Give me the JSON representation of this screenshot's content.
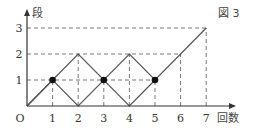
{
  "figure_label": "図 3",
  "axes": {
    "x_label": "回数",
    "y_label": "段",
    "origin_label": "O",
    "x_ticks": [
      "1",
      "2",
      "3",
      "4",
      "5",
      "6",
      "7"
    ],
    "y_ticks": [
      "1",
      "2",
      "3"
    ]
  },
  "chart_data": {
    "type": "line",
    "title": "図 3",
    "xlabel": "回数",
    "ylabel": "段",
    "x_range": [
      0,
      7
    ],
    "y_range": [
      0,
      3
    ],
    "path": [
      [
        0,
        0
      ],
      [
        1,
        1
      ],
      [
        2,
        2
      ],
      [
        3,
        1
      ],
      [
        4,
        2
      ],
      [
        5,
        1
      ],
      [
        6,
        2
      ],
      [
        7,
        3
      ]
    ],
    "secondary_path": [
      [
        0,
        0
      ],
      [
        1,
        1
      ],
      [
        2,
        0
      ],
      [
        3,
        1
      ],
      [
        4,
        0
      ],
      [
        5,
        1
      ]
    ],
    "highlighted_points": [
      [
        1,
        1
      ],
      [
        3,
        1
      ],
      [
        5,
        1
      ]
    ],
    "guide_lines": "dashed"
  },
  "colors": {
    "line": "#555555",
    "dash": "#777777",
    "point": "#111111"
  }
}
